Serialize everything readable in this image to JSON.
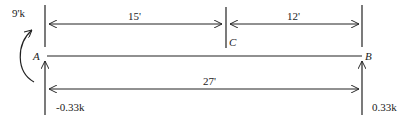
{
  "diagram": {
    "type": "beam-free-body",
    "colors": {
      "line": "#222222",
      "background": "#ffffff"
    },
    "points": [
      {
        "id": "A",
        "label": "A"
      },
      {
        "id": "C",
        "label": "C"
      },
      {
        "id": "B",
        "label": "B"
      }
    ],
    "applied_moment": {
      "label": "9'k",
      "at": "A",
      "direction": "counterclockwise"
    },
    "dimensions": {
      "top_left": {
        "label": "15'",
        "from": "A",
        "to": "C"
      },
      "top_right": {
        "label": "12'",
        "from": "C",
        "to": "B"
      },
      "bottom": {
        "label": "27'",
        "from": "A",
        "to": "B"
      }
    },
    "reactions": {
      "A": {
        "label": "-0.33k",
        "direction": "up"
      },
      "B": {
        "label": "0.33k",
        "direction": "up"
      }
    }
  }
}
